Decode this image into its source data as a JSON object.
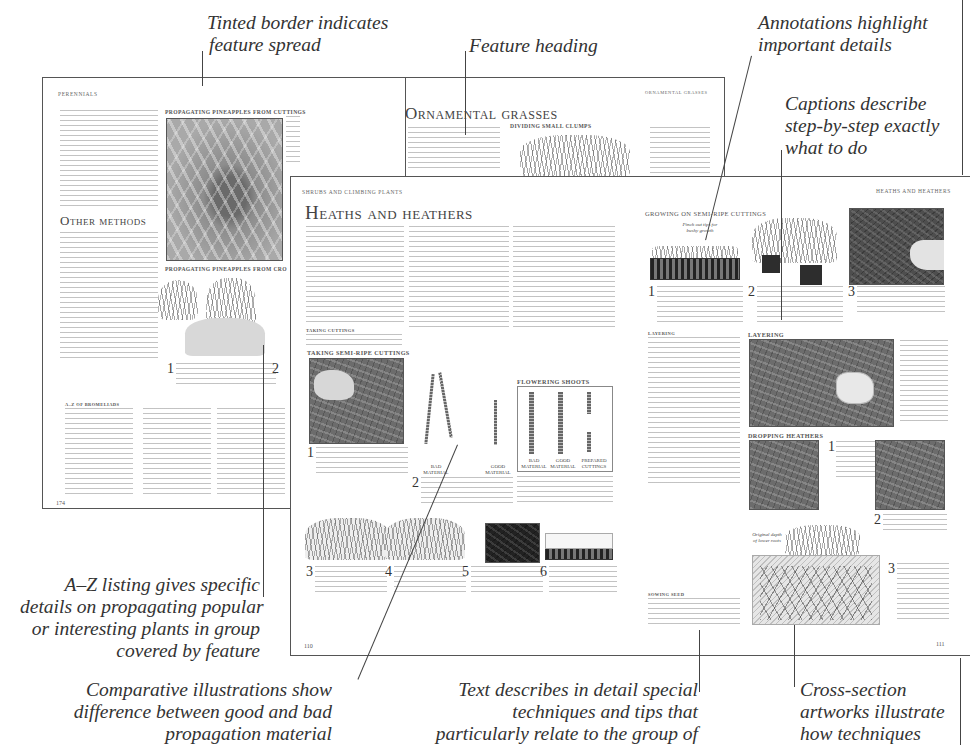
{
  "annotations": {
    "tinted_border": [
      "Tinted border indicates",
      "feature spread"
    ],
    "feature_heading": [
      "Feature heading"
    ],
    "annotations_highlight": [
      "Annotations highlight",
      "important details"
    ],
    "captions_describe": [
      "Captions describe",
      "step-by-step exactly",
      "what to do"
    ],
    "a_z_listing": [
      "A–Z listing gives specific",
      "details on propagating popular",
      "or interesting plants in group",
      "covered by feature"
    ],
    "comparative": [
      "Comparative illustrations show",
      "difference between good and bad",
      "propagation material"
    ],
    "text_describes": [
      "Text describes in detail special",
      "techniques and tips that",
      "particularly relate to the group of"
    ],
    "cross_section": [
      "Cross-section",
      "artworks illustrate",
      "how techniques"
    ]
  },
  "back_spread": {
    "left_page": {
      "running_head": "Perennials",
      "section_heading": "Other methods",
      "photo_heading_1": "Propagating pineapples from cuttings",
      "photo_heading_2": "Propagating pineapples from cro",
      "step_1": "1",
      "step_2": "2",
      "a_z_heading": "A–Z of bromeliads",
      "page_number": "174"
    },
    "right_page": {
      "running_head": "Ornamental grasses",
      "title": "Ornamental grasses",
      "section_heading": "Dividing small clumps"
    }
  },
  "front_spread": {
    "left_page": {
      "running_head": "Shrubs and climbing plants",
      "title": "Heaths and heathers",
      "subhead_taking_cuttings": "Taking cuttings",
      "section_taking": "Taking semi-ripe cuttings",
      "section_flowering": "Flowering shoots",
      "labels": {
        "bad_material": "Bad material",
        "good_material": "Good material",
        "prepared_cuttings": "Prepared cuttings"
      },
      "steps": [
        "1",
        "2",
        "3",
        "4",
        "5",
        "6"
      ],
      "page_number": "110"
    },
    "right_page": {
      "running_head": "Heaths and heathers",
      "section_growing": "Growing on semi-ripe cuttings",
      "pinch_label": "Pinch out tips for bushy growth",
      "subhead_layering": "Layering",
      "section_layering": "Layering",
      "section_dropping": "Dropping heathers",
      "subhead_sowing": "Sowing seed",
      "original_depth_label": "Original depth of lower roots",
      "steps": [
        "1",
        "2",
        "3"
      ],
      "page_number": "111"
    }
  }
}
